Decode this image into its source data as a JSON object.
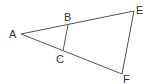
{
  "diagram": {
    "type": "geometry",
    "labels": {
      "A": "A",
      "B": "B",
      "C": "C",
      "E": "E",
      "F": "F"
    },
    "segments": [
      "AE",
      "AF",
      "EF",
      "BC"
    ],
    "colors": {
      "line": "#555555",
      "text": "#333333"
    }
  }
}
